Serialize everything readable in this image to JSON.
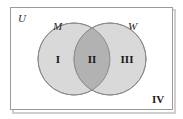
{
  "figure": {
    "type": "venn-diagram",
    "width": 183,
    "height": 119,
    "background_color": "#ffffff"
  },
  "universe": {
    "label": "U",
    "border_color": "#9a9a9a",
    "shadow_color": "#c9c9c9",
    "fill_color": "#ffffff"
  },
  "sets": [
    {
      "label": "M",
      "fill_color": "#d9d9d9",
      "stroke_color": "#8c8c8c",
      "cx": 74,
      "cy": 59,
      "r": 36
    },
    {
      "label": "W",
      "fill_color": "#d9d9d9",
      "stroke_color": "#8c8c8c",
      "cx": 110,
      "cy": 59,
      "r": 36
    }
  ],
  "intersection": {
    "fill_color": "#b2b2b2",
    "stroke_color": "#8c8c8c"
  },
  "regions": [
    {
      "label": "I",
      "meaning": "M only",
      "x": 58,
      "y": 63
    },
    {
      "label": "II",
      "meaning": "M and W",
      "x": 92,
      "y": 63
    },
    {
      "label": "III",
      "meaning": "W only",
      "x": 127,
      "y": 63
    },
    {
      "label": "IV",
      "meaning": "neither M nor W",
      "x": 158,
      "y": 103
    }
  ],
  "universe_label_position": {
    "x": 18,
    "y": 22
  },
  "set_label_positions": [
    {
      "label": "M",
      "x": 53,
      "y": 30
    },
    {
      "label": "W",
      "x": 128,
      "y": 30
    }
  ]
}
